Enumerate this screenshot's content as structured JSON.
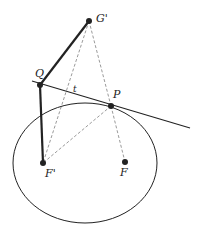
{
  "diagram": {
    "type": "geometry",
    "colors": {
      "stroke": "#222222",
      "background": "#ffffff",
      "dashed": "#555555"
    },
    "ellipse": {
      "cx": 85,
      "cy": 163,
      "rx": 72,
      "ry": 60
    },
    "points": {
      "G_prime": {
        "label": "G'",
        "x": 89,
        "y": 21
      },
      "Q": {
        "label": "Q",
        "x": 40,
        "y": 85
      },
      "P": {
        "label": "P",
        "x": 111,
        "y": 106
      },
      "F_prime": {
        "label": "F'",
        "x": 43,
        "y": 163
      },
      "F": {
        "label": "F",
        "x": 125,
        "y": 162
      }
    },
    "tangent": {
      "label": "t",
      "x1": 32,
      "y1": 81,
      "x2": 190,
      "y2": 128
    },
    "labels": {
      "G_prime": "G'",
      "Q": "Q",
      "P": "P",
      "F_prime": "F'",
      "F": "F",
      "t": "t"
    }
  }
}
